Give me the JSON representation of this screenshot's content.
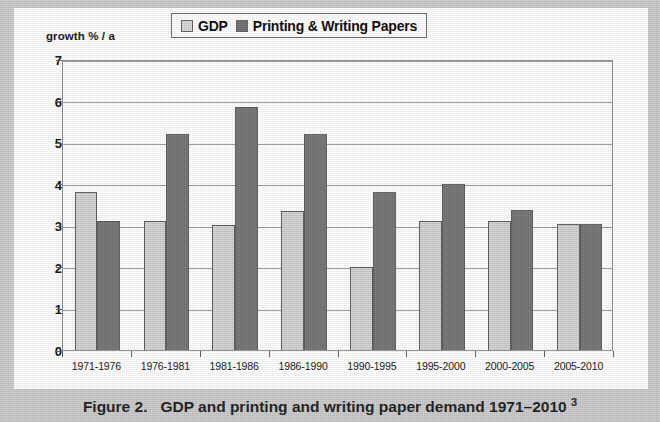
{
  "figure": {
    "caption_label": "Figure 2.",
    "caption_text": "GDP and printing and writing paper demand 1971–2010",
    "caption_superscript": "3"
  },
  "chart_data": {
    "type": "bar",
    "title": "",
    "axis_title": "growth % / a",
    "xlabel": "",
    "ylabel": "growth % / a",
    "ylim": [
      0,
      7
    ],
    "ytick_labels": [
      "0",
      "1",
      "2",
      "3",
      "4",
      "5",
      "6",
      "7"
    ],
    "ytick_values": [
      0,
      1,
      2,
      3,
      4,
      5,
      6,
      7
    ],
    "grid": true,
    "legend_position": "top-center",
    "categories": [
      "1971-1976",
      "1976-1981",
      "1981-1986",
      "1986-1990",
      "1990-1995",
      "1995-2000",
      "2000-2005",
      "2005-2010"
    ],
    "series": [
      {
        "name": "GDP",
        "color": "#d6d6d6",
        "values": [
          3.8,
          3.1,
          3.0,
          3.35,
          2.0,
          3.1,
          3.1,
          3.03
        ]
      },
      {
        "name": "Printing & Writing Papers",
        "color": "#6e6e6e",
        "values": [
          3.1,
          5.2,
          5.85,
          5.2,
          3.8,
          4.0,
          3.37,
          3.03
        ]
      }
    ]
  },
  "colors": {
    "gdp": "#d6d6d6",
    "printing_writing": "#6e6e6e",
    "grid": "#9a9a9a",
    "axis": "#5d5d5d",
    "page_border": "#c9c9c9"
  }
}
